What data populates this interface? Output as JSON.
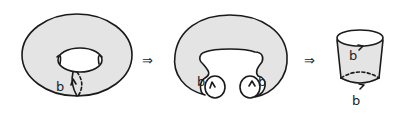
{
  "diagram": {
    "steps": [
      {
        "name": "torus",
        "label": "b"
      },
      {
        "name": "cut-torus",
        "labels": [
          "b",
          "b"
        ]
      },
      {
        "name": "cylinder",
        "labels": [
          "b",
          "b"
        ]
      }
    ],
    "arrows": [
      "⇒",
      "⇒"
    ],
    "colors": {
      "surface": "#e4e4e4",
      "ink": "#1a1a1a",
      "background": "#ffffff"
    }
  }
}
